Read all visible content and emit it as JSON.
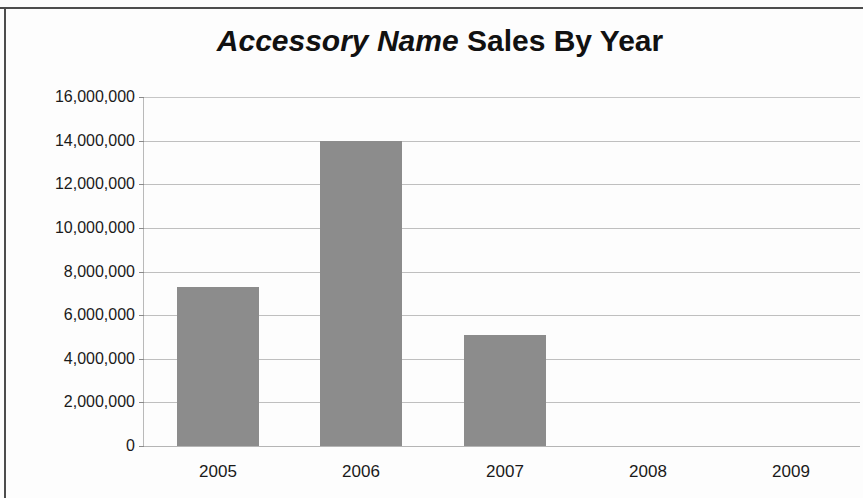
{
  "chart_data": {
    "type": "bar",
    "title": "Accessory Name Sales By Year",
    "title_emphasis": "Accessory Name",
    "title_rest": " Sales By Year",
    "xlabel": "",
    "ylabel": "",
    "categories": [
      "2005",
      "2006",
      "2007",
      "2008",
      "2009"
    ],
    "values": [
      7300000,
      14000000,
      5100000,
      0,
      0
    ],
    "ylim": [
      0,
      16000000
    ],
    "ytick_values": [
      0,
      2000000,
      4000000,
      6000000,
      8000000,
      10000000,
      12000000,
      14000000,
      16000000
    ],
    "ytick_labels": [
      "0",
      "2,000,000",
      "4,000,000",
      "6,000,000",
      "8,000,000",
      "10,000,000",
      "12,000,000",
      "14,000,000",
      "16,000,000"
    ],
    "grid": true,
    "legend": false,
    "legend_position": "none",
    "series": [
      {
        "name": "Sales",
        "color": "#8c8c8c",
        "values": [
          7300000,
          14000000,
          5100000,
          0,
          0
        ]
      }
    ],
    "colors": {
      "bar": "#8c8c8c",
      "gridline": "#bfbfbf",
      "text": "#1a1a1a",
      "background": "#fdfdfd",
      "frame": "#4d4d4d"
    }
  }
}
